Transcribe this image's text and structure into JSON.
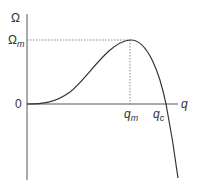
{
  "diagram": {
    "type": "function-curve",
    "axes": {
      "y_label": "Ω",
      "x_label": "q",
      "origin_label": "0"
    },
    "annotations": {
      "max_value_label_main": "Ω",
      "max_value_label_sub": "m",
      "peak_position_label_main": "q",
      "peak_position_label_sub": "m",
      "critical_label_main": "q",
      "critical_label_sub": "c"
    },
    "colors": {
      "curve": "#333333",
      "axes": "#555555",
      "guides": "#888888"
    }
  }
}
